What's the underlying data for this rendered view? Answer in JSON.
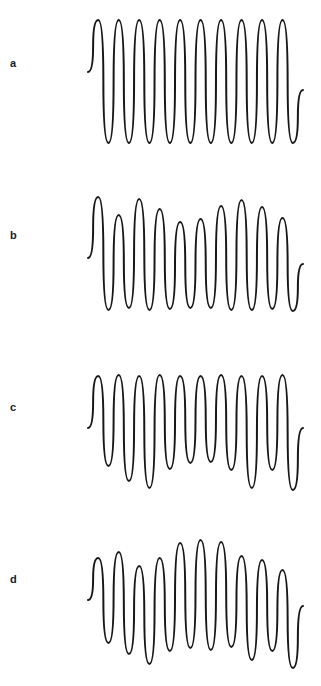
{
  "figure": {
    "background_color": "#ffffff",
    "stroke_color": "#171717",
    "width": 321,
    "height": 686
  },
  "panels": [
    {
      "label": "a",
      "label_x": 10,
      "label_y": 64,
      "top": 0,
      "height": 172,
      "description": "constant-amplitude oscillation"
    },
    {
      "label": "b",
      "label_x": 10,
      "label_y": 236,
      "top": 172,
      "height": 172,
      "description": "amplitude-modulated oscillation with alternating peak heights"
    },
    {
      "label": "c",
      "label_x": 10,
      "label_y": 408,
      "top": 344,
      "height": 172,
      "description": "uniform peaks with varying trough depths"
    },
    {
      "label": "d",
      "label_x": 10,
      "label_y": 580,
      "top": 516,
      "height": 170,
      "description": "envelope-modulated oscillation bulging mid-trace"
    }
  ],
  "chart_data": {
    "type": "line",
    "title": "",
    "xlabel": "",
    "ylabel": "",
    "grid": false,
    "legend": "none",
    "x_start_px": 88,
    "x_end_px": 303,
    "cycles_per_trace": 10,
    "series": [
      {
        "name": "a",
        "baseline_y": 81,
        "start_y": 72,
        "end_y": 90,
        "peaks": [
          20,
          20,
          20,
          20,
          20,
          20,
          20,
          20,
          20,
          20
        ],
        "troughs": [
          143,
          143,
          143,
          143,
          143,
          143,
          143,
          143,
          143,
          143
        ]
      },
      {
        "name": "b",
        "baseline_y": 253,
        "start_y": 258,
        "end_y": 264,
        "peaks": [
          197,
          215,
          199,
          209,
          222,
          219,
          206,
          200,
          207,
          218
        ],
        "troughs": [
          310,
          308,
          310,
          309,
          308,
          308,
          310,
          310,
          309,
          311
        ]
      },
      {
        "name": "c",
        "baseline_y": 425,
        "start_y": 428,
        "end_y": 428,
        "peaks": [
          376,
          375,
          376,
          375,
          376,
          376,
          375,
          376,
          376,
          375
        ],
        "troughs": [
          466,
          481,
          488,
          469,
          463,
          462,
          470,
          488,
          470,
          490
        ]
      },
      {
        "name": "d",
        "baseline_y": 600,
        "start_y": 600,
        "end_y": 606,
        "peaks": [
          558,
          552,
          566,
          558,
          543,
          540,
          542,
          556,
          560,
          570
        ],
        "troughs": [
          643,
          654,
          664,
          651,
          648,
          650,
          647,
          660,
          651,
          668
        ]
      }
    ]
  }
}
